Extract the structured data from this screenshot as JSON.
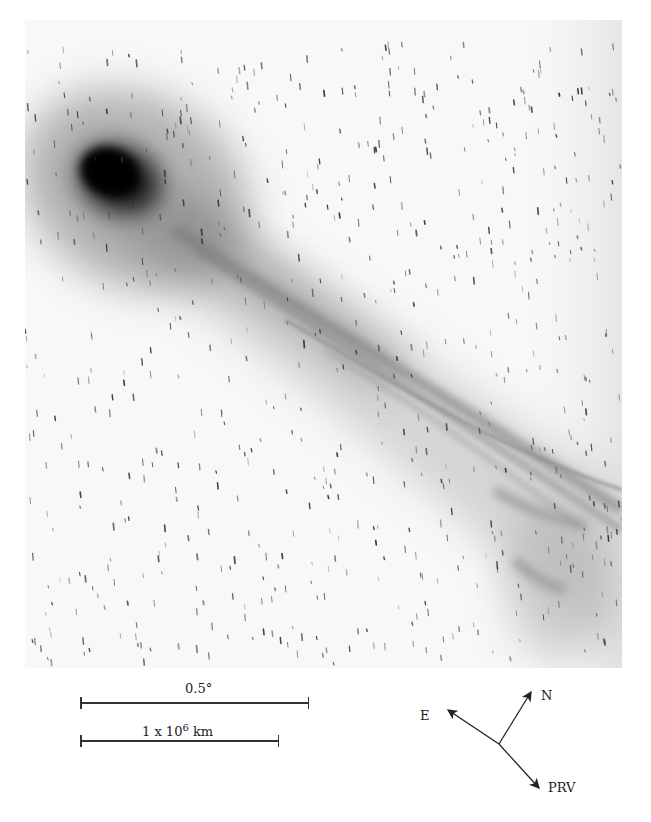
{
  "figure": {
    "colors": {
      "background": "#ffffff",
      "sky": "#f6f6f6",
      "coma": "#0d0d0d",
      "tail": "#6a6a6a",
      "annotation": "#222222"
    }
  },
  "scale_bars": {
    "angular": {
      "label": "0.5°"
    },
    "distance": {
      "label_prefix": "1 x 10",
      "label_exponent": "6",
      "label_unit": " km"
    }
  },
  "compass": {
    "north_label": "N",
    "east_label": "E",
    "prv_label": "PRV"
  }
}
